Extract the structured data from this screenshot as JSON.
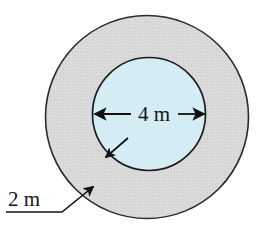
{
  "figure": {
    "background_color": "#ffffff"
  },
  "shapes": {
    "outer_circle": {
      "name": "outer-circle",
      "fill_color": "#d9d9d9",
      "stroke_color": "#2b2b2b",
      "center_x": 147,
      "center_y": 117,
      "radius": 102
    },
    "inner_circle": {
      "name": "inner-circle",
      "fill_color": "#d4ecf4",
      "stroke_color": "#1d1d1d",
      "center_x": 149,
      "center_y": 114,
      "radius": 57
    }
  },
  "annotations": {
    "diameter": {
      "label": "4 m",
      "label_x": 149,
      "label_y": 122,
      "line_y": 114,
      "line_start_x": 93,
      "line_end_x": 206,
      "color": "#111111"
    },
    "ring_width": {
      "label": "2 m",
      "label_x": 8,
      "label_y": 203,
      "underline_start_x": 6,
      "underline_end_x": 62,
      "underline_y": 212,
      "leader_elbow_x": 62,
      "leader_tip_x": 95,
      "leader_tip_y": 185,
      "color": "#111111"
    },
    "radius_pointer": {
      "name": "inner-edge-pointer",
      "start_x": 128,
      "start_y": 138,
      "end_x": 104,
      "end_y": 159,
      "color": "#111111"
    }
  }
}
